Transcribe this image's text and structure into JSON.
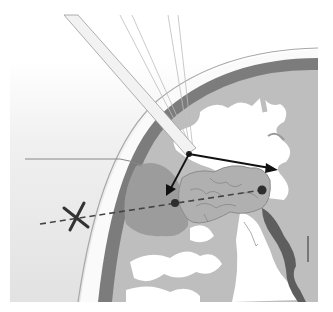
{
  "figure": {
    "colors": {
      "background": "#ffffff",
      "outside_gradient_top": "#ffffff",
      "outside_gradient_bottom": "#e4e4e4",
      "skull_outline": "#9a9a9a",
      "cortex_dark": "#7a7a7a",
      "gray_matter": "#bdbdbd",
      "white_matter": "#ffffff",
      "lesion_fill": "#a8a8a8",
      "tumor_fill": "#b4b4b4",
      "ventricle": "#606060",
      "arrow": "#111111",
      "trajectory": "#444444",
      "marker_x": "#333333",
      "target_dot": "#2e2e2e"
    },
    "elements": [
      "needle-probe",
      "stereotactic-beams",
      "skull-arc",
      "cortex-band",
      "gyri",
      "lesion",
      "tumor-mass",
      "entry-point",
      "measurement-arrow-horizontal",
      "measurement-arrow-downward",
      "trajectory-line",
      "target-dot-left",
      "target-dot-right",
      "x-marker",
      "ventricle",
      "reference-line"
    ]
  }
}
